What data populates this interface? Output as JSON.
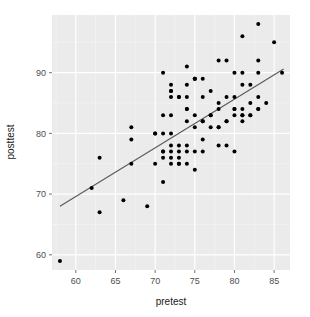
{
  "chart_data": {
    "type": "scatter",
    "title": "",
    "xlabel": "pretest",
    "ylabel": "posttest",
    "xlim": [
      57.0,
      87.0
    ],
    "ylim": [
      57.5,
      99.5
    ],
    "xticks": [
      60,
      65,
      70,
      75,
      80,
      85
    ],
    "yticks": [
      60,
      70,
      80,
      90
    ],
    "grid": true,
    "legend": "none",
    "panel_background": "#ebebeb",
    "gridline_color": "#ffffff",
    "point_color": "#000000",
    "point_size": 2.0,
    "trendline": {
      "type": "linear",
      "color": "#595959",
      "x_start": 58.0,
      "y_start": 68.0,
      "x_end": 86.2,
      "y_end": 90.6
    },
    "points": [
      {
        "x": 58,
        "y": 59
      },
      {
        "x": 62,
        "y": 71
      },
      {
        "x": 63,
        "y": 76
      },
      {
        "x": 63,
        "y": 67
      },
      {
        "x": 66,
        "y": 69
      },
      {
        "x": 67,
        "y": 81
      },
      {
        "x": 67,
        "y": 79
      },
      {
        "x": 67,
        "y": 75
      },
      {
        "x": 69,
        "y": 68
      },
      {
        "x": 70,
        "y": 80
      },
      {
        "x": 70,
        "y": 75
      },
      {
        "x": 71,
        "y": 90
      },
      {
        "x": 71,
        "y": 83
      },
      {
        "x": 71,
        "y": 80
      },
      {
        "x": 71,
        "y": 77
      },
      {
        "x": 71,
        "y": 76
      },
      {
        "x": 71,
        "y": 72
      },
      {
        "x": 72,
        "y": 88
      },
      {
        "x": 72,
        "y": 87
      },
      {
        "x": 72,
        "y": 86
      },
      {
        "x": 72,
        "y": 83
      },
      {
        "x": 72,
        "y": 80
      },
      {
        "x": 72,
        "y": 78
      },
      {
        "x": 72,
        "y": 77
      },
      {
        "x": 72,
        "y": 76
      },
      {
        "x": 72,
        "y": 75
      },
      {
        "x": 73,
        "y": 86
      },
      {
        "x": 73,
        "y": 78
      },
      {
        "x": 73,
        "y": 77
      },
      {
        "x": 73,
        "y": 76
      },
      {
        "x": 73,
        "y": 75
      },
      {
        "x": 74,
        "y": 91
      },
      {
        "x": 74,
        "y": 88
      },
      {
        "x": 74,
        "y": 86
      },
      {
        "x": 74,
        "y": 84
      },
      {
        "x": 74,
        "y": 82
      },
      {
        "x": 74,
        "y": 78
      },
      {
        "x": 74,
        "y": 77
      },
      {
        "x": 74,
        "y": 75
      },
      {
        "x": 75,
        "y": 89
      },
      {
        "x": 75,
        "y": 89
      },
      {
        "x": 75,
        "y": 83
      },
      {
        "x": 75,
        "y": 81
      },
      {
        "x": 75,
        "y": 77
      },
      {
        "x": 75,
        "y": 74
      },
      {
        "x": 76,
        "y": 89
      },
      {
        "x": 76,
        "y": 86
      },
      {
        "x": 76,
        "y": 82
      },
      {
        "x": 76,
        "y": 79
      },
      {
        "x": 76,
        "y": 77
      },
      {
        "x": 77,
        "y": 87
      },
      {
        "x": 77,
        "y": 83
      },
      {
        "x": 77,
        "y": 81
      },
      {
        "x": 78,
        "y": 92
      },
      {
        "x": 78,
        "y": 85
      },
      {
        "x": 78,
        "y": 84
      },
      {
        "x": 78,
        "y": 81
      },
      {
        "x": 78,
        "y": 78
      },
      {
        "x": 79,
        "y": 92
      },
      {
        "x": 79,
        "y": 86
      },
      {
        "x": 79,
        "y": 82
      },
      {
        "x": 79,
        "y": 78
      },
      {
        "x": 80,
        "y": 90
      },
      {
        "x": 80,
        "y": 86
      },
      {
        "x": 80,
        "y": 84
      },
      {
        "x": 80,
        "y": 83
      },
      {
        "x": 80,
        "y": 77
      },
      {
        "x": 81,
        "y": 96
      },
      {
        "x": 81,
        "y": 90
      },
      {
        "x": 81,
        "y": 88
      },
      {
        "x": 81,
        "y": 84
      },
      {
        "x": 81,
        "y": 83
      },
      {
        "x": 81,
        "y": 82
      },
      {
        "x": 82,
        "y": 88
      },
      {
        "x": 82,
        "y": 85
      },
      {
        "x": 82,
        "y": 83
      },
      {
        "x": 83,
        "y": 98
      },
      {
        "x": 83,
        "y": 92
      },
      {
        "x": 83,
        "y": 90
      },
      {
        "x": 83,
        "y": 86
      },
      {
        "x": 83,
        "y": 84
      },
      {
        "x": 84,
        "y": 85
      },
      {
        "x": 85,
        "y": 95
      },
      {
        "x": 86,
        "y": 90
      },
      {
        "x": 70,
        "y": 80
      },
      {
        "x": 73,
        "y": 86
      },
      {
        "x": 75,
        "y": 89
      },
      {
        "x": 77,
        "y": 83
      },
      {
        "x": 80,
        "y": 84
      },
      {
        "x": 72,
        "y": 87
      },
      {
        "x": 74,
        "y": 84
      },
      {
        "x": 76,
        "y": 82
      },
      {
        "x": 71,
        "y": 77
      },
      {
        "x": 73,
        "y": 75
      },
      {
        "x": 79,
        "y": 82
      },
      {
        "x": 81,
        "y": 83
      },
      {
        "x": 82,
        "y": 83
      },
      {
        "x": 83,
        "y": 84
      },
      {
        "x": 78,
        "y": 81
      }
    ]
  },
  "axes": {
    "x": {
      "title": "pretest",
      "tick_labels": [
        "60",
        "65",
        "70",
        "75",
        "80",
        "85"
      ]
    },
    "y": {
      "title": "posttest",
      "tick_labels": [
        "60",
        "70",
        "80",
        "90"
      ]
    }
  }
}
